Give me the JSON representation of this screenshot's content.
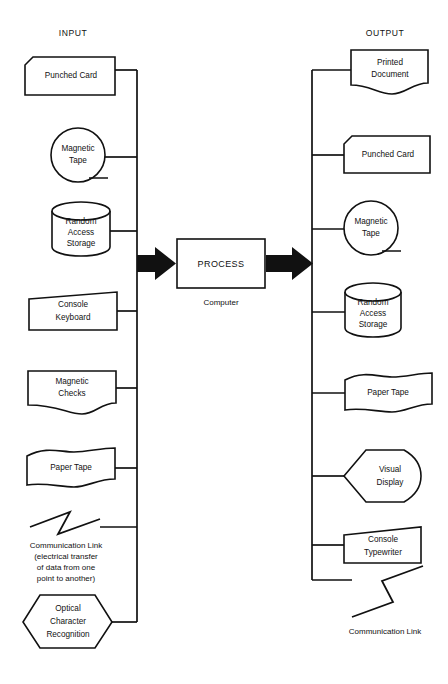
{
  "diagram": {
    "title_left": "INPUT",
    "title_right": "OUTPUT",
    "process": {
      "label": "PROCESS",
      "caption": "Computer"
    },
    "input_nodes": [
      {
        "label_lines": [
          "Punched Card"
        ],
        "shape": "punched-card"
      },
      {
        "label_lines": [
          "Magnetic",
          "Tape"
        ],
        "shape": "magnetic-tape"
      },
      {
        "label_lines": [
          "Random",
          "Access",
          "Storage"
        ],
        "shape": "random-access-storage"
      },
      {
        "label_lines": [
          "Console",
          "Keyboard"
        ],
        "shape": "manual-input"
      },
      {
        "label_lines": [
          "Magnetic",
          "Checks"
        ],
        "shape": "document"
      },
      {
        "label_lines": [
          "Paper Tape"
        ],
        "shape": "paper-tape"
      },
      {
        "label_lines": [
          "Communication Link",
          "(electrical transfer",
          "of data from one",
          "point to another)"
        ],
        "shape": "communication-link"
      },
      {
        "label_lines": [
          "Optical",
          "Character",
          "Recognition"
        ],
        "shape": "preparation-hexagon"
      }
    ],
    "output_nodes": [
      {
        "label_lines": [
          "Printed",
          "Document"
        ],
        "shape": "document"
      },
      {
        "label_lines": [
          "Punched Card"
        ],
        "shape": "punched-card"
      },
      {
        "label_lines": [
          "Magnetic",
          "Tape"
        ],
        "shape": "magnetic-tape"
      },
      {
        "label_lines": [
          "Random",
          "Access",
          "Storage"
        ],
        "shape": "random-access-storage"
      },
      {
        "label_lines": [
          "Paper Tape"
        ],
        "shape": "paper-tape"
      },
      {
        "label_lines": [
          "Visual",
          "Display"
        ],
        "shape": "display"
      },
      {
        "label_lines": [
          "Console",
          "Typewriter"
        ],
        "shape": "manual-input"
      },
      {
        "label_lines": [
          "Communication Link"
        ],
        "shape": "communication-link"
      }
    ],
    "colors": {
      "stroke": "#111111",
      "background": "#ffffff",
      "arrow_fill": "#111111"
    }
  }
}
